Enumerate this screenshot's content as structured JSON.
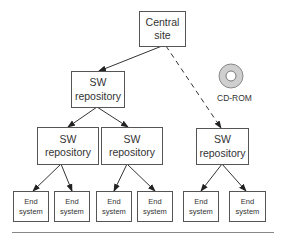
{
  "diagram": {
    "nodes": {
      "central": {
        "line1": "Central",
        "line2": "site"
      },
      "repo_top": {
        "line1": "SW",
        "line2": "repository"
      },
      "repo_mid_left": {
        "line1": "SW",
        "line2": "repository"
      },
      "repo_mid_right": {
        "line1": "SW",
        "line2": "repository"
      },
      "repo_right": {
        "line1": "SW",
        "line2": "repository"
      },
      "end_systems": [
        {
          "line1": "End",
          "line2": "system"
        },
        {
          "line1": "End",
          "line2": "system"
        },
        {
          "line1": "End",
          "line2": "system"
        },
        {
          "line1": "End",
          "line2": "system"
        },
        {
          "line1": "End",
          "line2": "system"
        },
        {
          "line1": "End",
          "line2": "system"
        }
      ]
    },
    "cdrom": {
      "label": "CD-ROM"
    },
    "edges": [
      {
        "from": "Central site",
        "to": "SW repository (top)",
        "style": "solid"
      },
      {
        "from": "Central site",
        "to": "SW repository (right)",
        "style": "dashed"
      },
      {
        "from": "SW repository (top)",
        "to": "SW repository (mid-left)",
        "style": "solid"
      },
      {
        "from": "SW repository (top)",
        "to": "SW repository (mid-right)",
        "style": "solid"
      },
      {
        "from": "SW repository (mid-left)",
        "to": "End system 1",
        "style": "solid"
      },
      {
        "from": "SW repository (mid-left)",
        "to": "End system 2",
        "style": "solid"
      },
      {
        "from": "SW repository (mid-right)",
        "to": "End system 3",
        "style": "solid"
      },
      {
        "from": "SW repository (mid-right)",
        "to": "End system 4",
        "style": "solid"
      },
      {
        "from": "SW repository (right)",
        "to": "End system 5",
        "style": "solid"
      },
      {
        "from": "SW repository (right)",
        "to": "End system 6",
        "style": "solid"
      }
    ]
  }
}
